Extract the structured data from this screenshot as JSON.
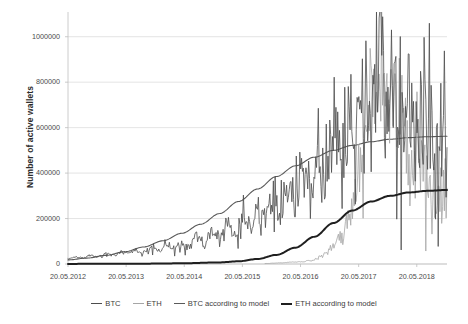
{
  "chart_data": {
    "type": "line",
    "title": "",
    "xlabel": "",
    "ylabel": "Number of active wallets",
    "grid": true,
    "legend_position": "bottom",
    "xlim": [
      "20.05.2012",
      "20.11.2018"
    ],
    "ylim": [
      0,
      1100000
    ],
    "yticks": [
      0,
      200000,
      400000,
      600000,
      800000,
      1000000
    ],
    "ytick_labels": [
      "0",
      "200000",
      "400000",
      "600000",
      "800000",
      "1000000"
    ],
    "xtick_labels": [
      "20.05.2012",
      "20.05.2013",
      "20.05.2014",
      "20.05.2015",
      "20.05.2016",
      "20.05.2017",
      "20.05.2018"
    ],
    "series": [
      {
        "name": "BTC",
        "color": "#4d4d4d",
        "width": 0.8,
        "style": "noisy-observed",
        "x": [
          0,
          0.02,
          0.04,
          0.06,
          0.08,
          0.1,
          0.12,
          0.14,
          0.16,
          0.18,
          0.2,
          0.22,
          0.24,
          0.26,
          0.28,
          0.3,
          0.32,
          0.34,
          0.36,
          0.38,
          0.4,
          0.42,
          0.44,
          0.46,
          0.48,
          0.5,
          0.52,
          0.54,
          0.56,
          0.58,
          0.6,
          0.62,
          0.64,
          0.66,
          0.68,
          0.7,
          0.72,
          0.74,
          0.76,
          0.78,
          0.8,
          0.82,
          0.84,
          0.86,
          0.88,
          0.9,
          0.92,
          0.94,
          0.96,
          0.98,
          1.0
        ],
        "values": [
          22000,
          31000,
          26000,
          40000,
          33000,
          45000,
          38000,
          52000,
          44000,
          61000,
          50000,
          72000,
          58000,
          95000,
          70000,
          86000,
          74000,
          120000,
          95000,
          150000,
          118000,
          175000,
          140000,
          205000,
          165000,
          240000,
          195000,
          300000,
          235000,
          360000,
          290000,
          430000,
          340000,
          520000,
          400000,
          620000,
          470000,
          700000,
          530000,
          810000,
          590000,
          1080000,
          640000,
          880000,
          690000,
          790000,
          600000,
          720000,
          560000,
          650000,
          470000
        ]
      },
      {
        "name": "ETH",
        "color": "#a6a6a6",
        "width": 0.8,
        "style": "noisy-observed",
        "x": [
          0.52,
          0.56,
          0.6,
          0.64,
          0.68,
          0.7,
          0.72,
          0.74,
          0.76,
          0.78,
          0.8,
          0.82,
          0.84,
          0.86,
          0.88,
          0.9,
          0.92,
          0.94,
          0.96,
          0.98,
          1.0
        ],
        "values": [
          2000,
          5000,
          9000,
          14000,
          45000,
          80000,
          120000,
          190000,
          320000,
          560000,
          760000,
          900000,
          760000,
          620000,
          560000,
          520000,
          440000,
          400000,
          350000,
          300000,
          330000
        ]
      },
      {
        "name": "BTC according to model",
        "color": "#5a5a5a",
        "width": 1.1,
        "style": "smooth-model",
        "x": [
          0,
          0.05,
          0.1,
          0.15,
          0.2,
          0.25,
          0.3,
          0.35,
          0.4,
          0.45,
          0.5,
          0.55,
          0.6,
          0.65,
          0.7,
          0.75,
          0.8,
          0.85,
          0.9,
          0.95,
          1.0
        ],
        "values": [
          18000,
          26000,
          38000,
          54000,
          75000,
          102000,
          135000,
          175000,
          222000,
          275000,
          330000,
          385000,
          432000,
          470000,
          500000,
          522000,
          538000,
          549000,
          556000,
          560000,
          562000
        ]
      },
      {
        "name": "ETH according to model",
        "color": "#1f1f1f",
        "width": 2.0,
        "style": "smooth-model",
        "x": [
          0,
          0.1,
          0.2,
          0.3,
          0.4,
          0.45,
          0.5,
          0.55,
          0.6,
          0.65,
          0.7,
          0.75,
          0.8,
          0.85,
          0.9,
          0.95,
          1.0
        ],
        "values": [
          500,
          800,
          1500,
          3000,
          7000,
          12000,
          22000,
          40000,
          72000,
          120000,
          180000,
          235000,
          275000,
          300000,
          315000,
          322000,
          326000
        ]
      }
    ]
  },
  "axes": {
    "y_title": "Number of active wallets",
    "y_tick_labels": [
      "1000000",
      "800000",
      "600000",
      "400000",
      "200000",
      "0"
    ],
    "x_tick_labels": [
      "20.05.2012",
      "20.05.2013",
      "20.05.2014",
      "20.05.2015",
      "20.05.2016",
      "20.05.2017",
      "20.05.2018"
    ]
  },
  "legend": {
    "items": [
      {
        "label": "BTC",
        "color": "#4d4d4d",
        "width": "1px"
      },
      {
        "label": "ETH",
        "color": "#a6a6a6",
        "width": "1px"
      },
      {
        "label": "BTC according to model",
        "color": "#5a5a5a",
        "width": "1.2px"
      },
      {
        "label": "ETH according to model",
        "color": "#1f1f1f",
        "width": "2px"
      }
    ]
  },
  "colors": {
    "grid": "#d9d9d9",
    "axis": "#bfbfbf",
    "text": "#4a4a4a",
    "background": "#ffffff"
  }
}
